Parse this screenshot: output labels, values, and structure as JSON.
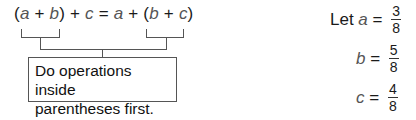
{
  "equation": {
    "lhs_open": "(",
    "a1": "a",
    "plus1": " + ",
    "b1": "b",
    "lhs_close": ")",
    "plus2": " + ",
    "c1": "c",
    "equals": " = ",
    "a2": "a",
    "plus3": " + ",
    "rhs_open": "(",
    "b2": "b",
    "plus4": " + ",
    "c2": "c",
    "rhs_close": ")"
  },
  "callout": {
    "line1": "Do operations inside",
    "line2": "parentheses first."
  },
  "given": [
    {
      "prefix": "Let ",
      "var": "a",
      "equals": " = ",
      "numerator": "3",
      "denominator": "8"
    },
    {
      "prefix": "",
      "var": "b",
      "equals": " = ",
      "numerator": "5",
      "denominator": "8"
    },
    {
      "prefix": "",
      "var": "c",
      "equals": " = ",
      "numerator": "4",
      "denominator": "8"
    }
  ]
}
